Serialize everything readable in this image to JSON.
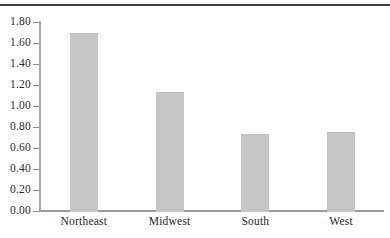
{
  "chart_data": {
    "type": "bar",
    "title": "",
    "subtitle": "",
    "xlabel": "",
    "ylabel": "",
    "categories": [
      "Northeast",
      "Midwest",
      "South",
      "West"
    ],
    "values": [
      1.7,
      1.13,
      0.73,
      0.75
    ],
    "series": [
      {
        "name": "",
        "values": [
          1.7,
          1.13,
          0.73,
          0.75
        ]
      }
    ],
    "ylim": [
      0.0,
      1.8
    ],
    "ytick_step": 0.2,
    "ytick_labels": [
      "0.00",
      "0.20",
      "0.40",
      "0.60",
      "0.80",
      "1.00",
      "1.20",
      "1.40",
      "1.60",
      "1.80"
    ],
    "ytick_values": [
      0.0,
      0.2,
      0.4,
      0.6,
      0.8,
      1.0,
      1.2,
      1.4,
      1.6,
      1.8
    ],
    "grid": false,
    "legend": false,
    "legend_position": "none",
    "annotations": [],
    "bar_color": "#c6c6c6",
    "axis_color": "#9a9a9a",
    "text_color": "#1f1f1f",
    "rule_color": "#3b3b3b"
  }
}
